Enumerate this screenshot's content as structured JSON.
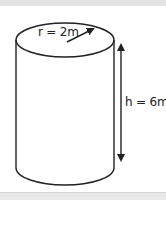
{
  "diagram": {
    "type": "cylinder",
    "radius_label": "r = 2m",
    "height_label": "h = 6m",
    "line_color": "#222222",
    "background": "#ffffff"
  }
}
